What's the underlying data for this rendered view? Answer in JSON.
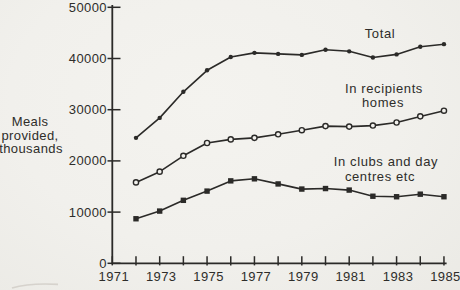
{
  "colors": {
    "paper": "#f2f1ed",
    "ink": "#2b2a28",
    "artifact": "#cfccc5"
  },
  "y_axis": {
    "title_lines": [
      "Meals",
      "provided,",
      "thousands"
    ],
    "tick_values": [
      0,
      10000,
      20000,
      30000,
      40000,
      50000
    ],
    "tick_labels": [
      "0",
      "10000",
      "20000",
      "30000",
      "40000",
      "50000"
    ]
  },
  "x_axis": {
    "tick_years": [
      1971,
      1972,
      1973,
      1974,
      1975,
      1976,
      1977,
      1978,
      1979,
      1980,
      1981,
      1982,
      1983,
      1984,
      1985
    ],
    "labeled_years": [
      1971,
      1973,
      1975,
      1977,
      1979,
      1981,
      1983,
      1985
    ],
    "labels": [
      "1971",
      "1973",
      "1975",
      "1977",
      "1979",
      "1981",
      "1983",
      "1985"
    ]
  },
  "annotations": {
    "total": {
      "lines": [
        "Total"
      ]
    },
    "homes": {
      "lines": [
        "In recipients",
        "homes"
      ]
    },
    "clubs": {
      "lines": [
        "In clubs and day",
        "centres etc"
      ]
    }
  },
  "chart_data": {
    "type": "line",
    "title": "",
    "xlabel": "",
    "ylabel": "Meals provided, thousands",
    "xlim": [
      1971,
      1985
    ],
    "ylim": [
      0,
      50000
    ],
    "grid": false,
    "legend_position": "inline-annotations",
    "x": [
      1972,
      1973,
      1974,
      1975,
      1976,
      1977,
      1978,
      1979,
      1980,
      1981,
      1982,
      1983,
      1984,
      1985
    ],
    "series": [
      {
        "name": "Total",
        "marker": "filled-dot",
        "values": [
          24500,
          28400,
          33500,
          37700,
          40300,
          41100,
          40900,
          40700,
          41700,
          41400,
          40200,
          40800,
          42300,
          42800
        ]
      },
      {
        "name": "In recipients homes",
        "marker": "open-circle",
        "values": [
          15800,
          17900,
          21000,
          23500,
          24200,
          24500,
          25200,
          26000,
          26800,
          26700,
          26900,
          27500,
          28700,
          29800
        ]
      },
      {
        "name": "In clubs and day centres etc",
        "marker": "filled-square",
        "values": [
          8700,
          10200,
          12300,
          14100,
          16100,
          16500,
          15500,
          14500,
          14600,
          14300,
          13100,
          13000,
          13500,
          13000
        ]
      }
    ]
  }
}
